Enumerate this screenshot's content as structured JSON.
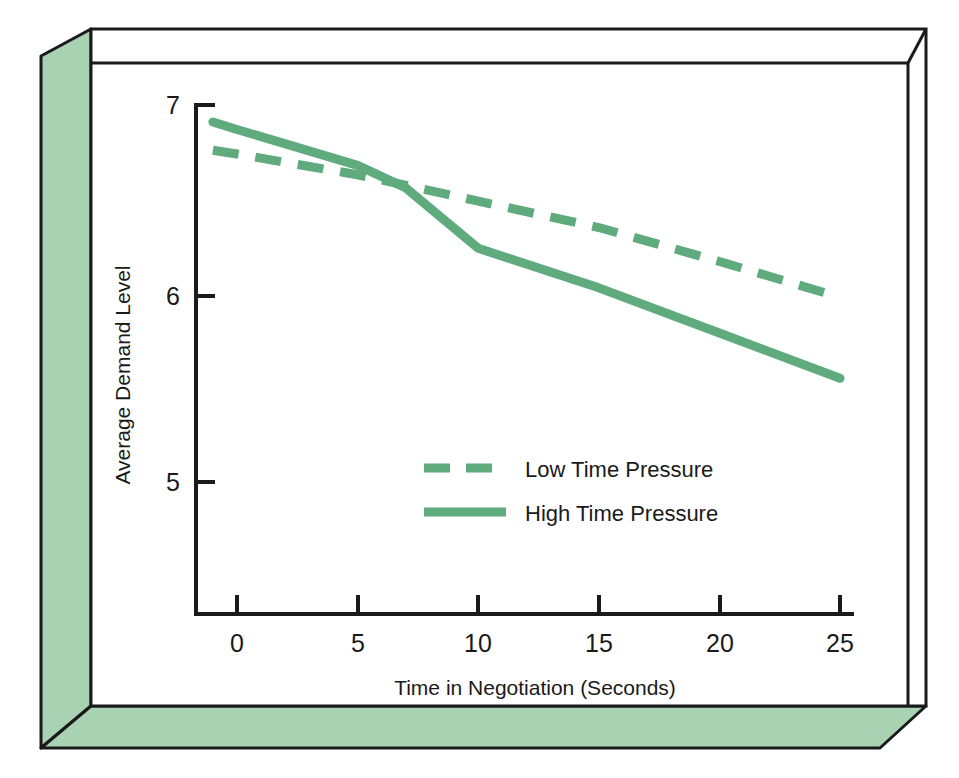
{
  "figure": {
    "background_color": "#ffffff",
    "panel_color": "#a8d2b2",
    "panel_edge_color": "#1a1a1a",
    "series_color": "#5fab7d"
  },
  "chart_data": {
    "type": "line",
    "title": "",
    "subtitle": "",
    "xlabel": "Time in Negotiation (Seconds)",
    "ylabel": "Average Demand Level",
    "xlim": [
      -1,
      25
    ],
    "ylim": [
      4.55,
      7.05
    ],
    "xticks": [
      0,
      5,
      10,
      15,
      20,
      25
    ],
    "xticklabels": [
      "0",
      "5",
      "10",
      "15",
      "20",
      "25"
    ],
    "yticks": [
      5,
      6,
      7
    ],
    "yticklabels": [
      "5",
      "6",
      "7"
    ],
    "grid": false,
    "legend_position": "center",
    "series": [
      {
        "name": "Low Time Pressure",
        "style": "dashed",
        "color": "#5fab7d",
        "x": [
          -1,
          0,
          5,
          10,
          15,
          20,
          25
        ],
        "y": [
          6.76,
          6.74,
          6.63,
          6.49,
          6.35,
          6.17,
          5.98
        ]
      },
      {
        "name": "High Time Pressure",
        "style": "solid",
        "color": "#5fab7d",
        "x": [
          -1,
          0,
          5,
          7,
          10,
          15,
          20,
          25
        ],
        "y": [
          6.91,
          6.87,
          6.68,
          6.56,
          6.24,
          6.03,
          5.79,
          5.55
        ]
      }
    ],
    "annotations": []
  },
  "legend": {
    "items": [
      {
        "label": "Low Time Pressure",
        "style": "dashed"
      },
      {
        "label": "High Time Pressure",
        "style": "solid"
      }
    ]
  }
}
